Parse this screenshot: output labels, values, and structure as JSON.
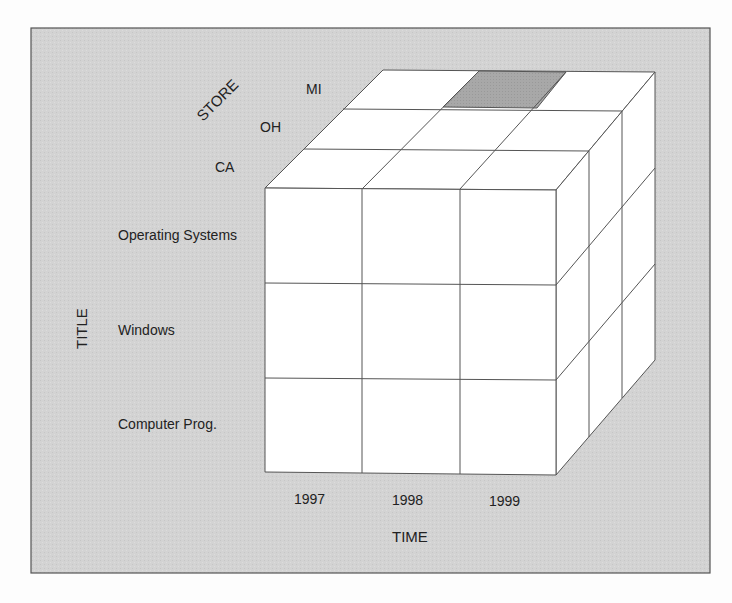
{
  "diagram": {
    "axes": {
      "store": {
        "label": "STORE",
        "members": [
          "CA",
          "OH",
          "MI"
        ]
      },
      "title": {
        "label": "TITLE",
        "members": [
          "Operating Systems",
          "Windows",
          "Computer Prog."
        ]
      },
      "time": {
        "label": "TIME",
        "members": [
          "1997",
          "1998",
          "1999"
        ]
      }
    },
    "highlighted_cell": {
      "store": "MI",
      "time": "1998",
      "title": "Operating Systems",
      "face": "top"
    },
    "colors": {
      "panel_bg": "#d4d4d4",
      "panel_border": "#555555",
      "cube_face": "#ffffff",
      "cube_line": "#555555",
      "highlight": "#a9a9a9",
      "text": "#222222"
    }
  }
}
